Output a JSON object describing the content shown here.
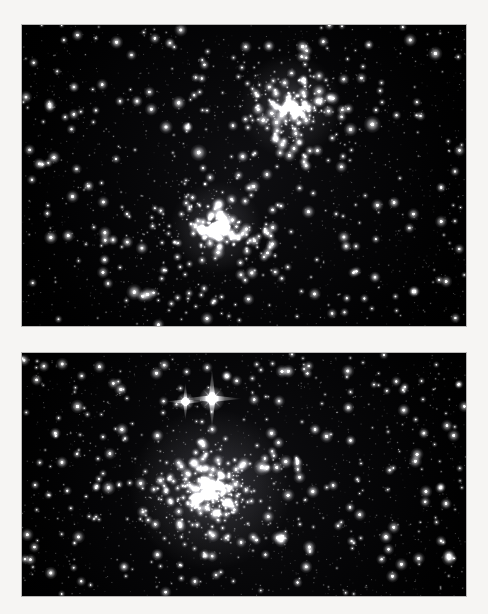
{
  "page": {
    "background_color": "#f6f5f3",
    "width": 488,
    "height": 614
  },
  "panels": [
    {
      "id": "panel-top",
      "label": "upper-starfield-panel",
      "x": 22,
      "y": 25,
      "width": 444,
      "height": 301,
      "sky_color": "#000000",
      "star_color": "#ffffff",
      "description": "Dense open star cluster field with two concentrations",
      "clusters": [
        {
          "name": "cluster-upper-right",
          "cx": 0.615,
          "cy": 0.285,
          "radius": 0.2,
          "count": 170,
          "core_cx": 0.605,
          "core_cy": 0.27,
          "core_radius": 0.045,
          "core_count": 60
        },
        {
          "name": "cluster-center-lower",
          "cx": 0.44,
          "cy": 0.675,
          "radius": 0.22,
          "count": 200,
          "core_cx": 0.437,
          "core_cy": 0.672,
          "core_radius": 0.04,
          "core_count": 75
        }
      ],
      "field_star_count": 520,
      "faint_star_count": 900,
      "bright_stars": [
        {
          "x": 0.213,
          "y": 0.057,
          "r": 2.3
        },
        {
          "x": 0.333,
          "y": 0.06,
          "r": 1.9
        },
        {
          "x": 0.556,
          "y": 0.07,
          "r": 2.1
        },
        {
          "x": 0.632,
          "y": 0.072,
          "r": 2.4
        },
        {
          "x": 0.781,
          "y": 0.066,
          "r": 1.8
        },
        {
          "x": 0.931,
          "y": 0.095,
          "r": 2.5
        },
        {
          "x": 0.117,
          "y": 0.206,
          "r": 1.9
        },
        {
          "x": 0.259,
          "y": 0.253,
          "r": 2.0
        },
        {
          "x": 0.353,
          "y": 0.259,
          "r": 2.5
        },
        {
          "x": 0.789,
          "y": 0.33,
          "r": 3.0
        },
        {
          "x": 0.585,
          "y": 0.3,
          "r": 2.7
        },
        {
          "x": 0.398,
          "y": 0.424,
          "r": 2.9
        },
        {
          "x": 0.497,
          "y": 0.437,
          "r": 2.1
        },
        {
          "x": 0.586,
          "y": 0.398,
          "r": 2.4
        },
        {
          "x": 0.64,
          "y": 0.468,
          "r": 2.0
        },
        {
          "x": 0.072,
          "y": 0.44,
          "r": 2.3
        },
        {
          "x": 0.15,
          "y": 0.535,
          "r": 2.0
        },
        {
          "x": 0.065,
          "y": 0.706,
          "r": 2.4
        },
        {
          "x": 0.104,
          "y": 0.7,
          "r": 2.2
        },
        {
          "x": 0.205,
          "y": 0.714,
          "r": 1.9
        },
        {
          "x": 0.253,
          "y": 0.887,
          "r": 2.8
        },
        {
          "x": 0.283,
          "y": 0.895,
          "r": 2.6
        },
        {
          "x": 0.428,
          "y": 0.63,
          "r": 2.2
        },
        {
          "x": 0.455,
          "y": 0.668,
          "r": 2.6
        },
        {
          "x": 0.73,
          "y": 0.735,
          "r": 2.0
        },
        {
          "x": 0.838,
          "y": 0.59,
          "r": 2.1
        },
        {
          "x": 0.944,
          "y": 0.54,
          "r": 1.8
        },
        {
          "x": 0.795,
          "y": 0.838,
          "r": 2.0
        },
        {
          "x": 0.186,
          "y": 0.78,
          "r": 1.9
        },
        {
          "x": 0.672,
          "y": 0.253,
          "r": 2.2
        }
      ],
      "spike_stars": []
    },
    {
      "id": "panel-bottom",
      "label": "lower-starfield-panel",
      "x": 22,
      "y": 353,
      "width": 444,
      "height": 243,
      "sky_color": "#000000",
      "star_color": "#ffffff",
      "description": "Open cluster with bright double star showing four-point diffraction spikes",
      "clusters": [
        {
          "name": "cluster-main",
          "cx": 0.43,
          "cy": 0.59,
          "radius": 0.24,
          "count": 300,
          "core_cx": 0.425,
          "core_cy": 0.56,
          "core_radius": 0.07,
          "core_count": 95
        }
      ],
      "field_star_count": 480,
      "faint_star_count": 820,
      "bright_stars": [
        {
          "x": 0.125,
          "y": 0.22,
          "r": 2.4
        },
        {
          "x": 0.075,
          "y": 0.33,
          "r": 2.0
        },
        {
          "x": 0.09,
          "y": 0.45,
          "r": 2.1
        },
        {
          "x": 0.225,
          "y": 0.315,
          "r": 2.3
        },
        {
          "x": 0.195,
          "y": 0.555,
          "r": 2.5
        },
        {
          "x": 0.305,
          "y": 0.34,
          "r": 2.2
        },
        {
          "x": 0.312,
          "y": 0.525,
          "r": 2.1
        },
        {
          "x": 0.39,
          "y": 0.455,
          "r": 2.6
        },
        {
          "x": 0.418,
          "y": 0.54,
          "r": 2.8
        },
        {
          "x": 0.5,
          "y": 0.455,
          "r": 2.4
        },
        {
          "x": 0.54,
          "y": 0.47,
          "r": 2.9
        },
        {
          "x": 0.462,
          "y": 0.62,
          "r": 2.5
        },
        {
          "x": 0.562,
          "y": 0.33,
          "r": 2.2
        },
        {
          "x": 0.66,
          "y": 0.315,
          "r": 2.0
        },
        {
          "x": 0.655,
          "y": 0.57,
          "r": 2.3
        },
        {
          "x": 0.735,
          "y": 0.225,
          "r": 2.1
        },
        {
          "x": 0.74,
          "y": 0.36,
          "r": 1.9
        },
        {
          "x": 0.86,
          "y": 0.235,
          "r": 2.2
        },
        {
          "x": 0.905,
          "y": 0.33,
          "r": 1.9
        },
        {
          "x": 0.955,
          "y": 0.62,
          "r": 2.0
        },
        {
          "x": 0.962,
          "y": 0.845,
          "r": 2.6
        },
        {
          "x": 0.64,
          "y": 0.88,
          "r": 2.2
        },
        {
          "x": 0.305,
          "y": 0.83,
          "r": 2.1
        },
        {
          "x": 0.23,
          "y": 0.88,
          "r": 2.0
        },
        {
          "x": 0.065,
          "y": 0.905,
          "r": 2.2
        },
        {
          "x": 0.43,
          "y": 0.75,
          "r": 2.4
        },
        {
          "x": 0.355,
          "y": 0.7,
          "r": 2.0
        },
        {
          "x": 0.6,
          "y": 0.075,
          "r": 2.3
        }
      ],
      "spike_stars": [
        {
          "name": "bright-star-primary",
          "x": 0.428,
          "y": 0.188,
          "core_r": 4.6,
          "spike_len": 30,
          "glow_r": 13
        },
        {
          "name": "bright-star-secondary",
          "x": 0.368,
          "y": 0.2,
          "core_r": 3.2,
          "spike_len": 19,
          "glow_r": 9
        }
      ]
    }
  ],
  "captions": {
    "top_panel": "",
    "bottom_panel": ""
  }
}
